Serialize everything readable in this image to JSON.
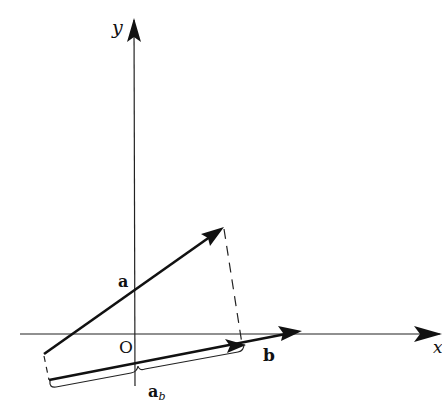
{
  "diagram": {
    "colors": {
      "ink": "#111111",
      "background": "#ffffff"
    },
    "axes": {
      "x_label": "x",
      "y_label": "y",
      "origin_label": "O"
    },
    "vectors": [
      {
        "name": "a",
        "label": "a",
        "from": [
          44,
          354
        ],
        "to": [
          224,
          227
        ]
      },
      {
        "name": "b",
        "label": "b",
        "from": [
          49,
          380
        ],
        "to": [
          301,
          331
        ]
      },
      {
        "name": "a_b",
        "label": "a",
        "subscript": "b",
        "from": [
          49,
          380
        ],
        "to": [
          245,
          345
        ]
      }
    ],
    "projection_lines": [
      {
        "from": [
          224,
          227
        ],
        "to": [
          242,
          342
        ],
        "style": "dashed"
      },
      {
        "from": [
          44,
          354
        ],
        "to": [
          49,
          380
        ],
        "style": "dashed"
      }
    ],
    "brace": {
      "from": [
        50,
        386
      ],
      "to": [
        245,
        350
      ],
      "label_ref": "a_b"
    }
  }
}
